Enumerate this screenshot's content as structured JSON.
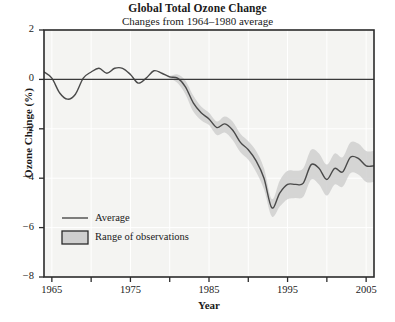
{
  "chart_data": {
    "type": "line",
    "title": "Global Total Ozone Change",
    "subtitle": "Changes from 1964–1980 average",
    "xlabel": "Year",
    "ylabel": "Ozone Change (%)",
    "xlim": [
      1964,
      2006
    ],
    "ylim": [
      -8,
      2
    ],
    "xticks": [
      1965,
      1975,
      1985,
      1995,
      2005
    ],
    "xtick_labels": [
      "1965",
      "1975",
      "1985",
      "1995",
      "2005"
    ],
    "xminor_ticks": [
      1970,
      1980,
      1990,
      2000
    ],
    "yticks": [
      2,
      0,
      -2,
      -4,
      -6,
      -8
    ],
    "ytick_labels": [
      "2",
      "0",
      "−2",
      "−4",
      "−6",
      "−8"
    ],
    "grid": true,
    "zero_line": 0,
    "legend_position": "bottom-left",
    "colors": {
      "line": "#4a4a4a",
      "band": "#cccccc",
      "band_edge": "#333333",
      "plot_background": "#f4f4f2",
      "gridline": "#ffffff",
      "frame": "#2b2b2b",
      "text": "#1a1a1a"
    },
    "series": [
      {
        "name": "Average",
        "x": [
          1964,
          1965,
          1966,
          1967,
          1968,
          1969,
          1970,
          1971,
          1972,
          1973,
          1974,
          1975,
          1976,
          1977,
          1978,
          1979,
          1980,
          1981,
          1982,
          1983,
          1984,
          1985,
          1986,
          1987,
          1988,
          1989,
          1990,
          1991,
          1992,
          1993,
          1994,
          1995,
          1996,
          1997,
          1998,
          1999,
          2000,
          2001,
          2002,
          2003,
          2004,
          2005,
          2006
        ],
        "values": [
          0.3,
          0.05,
          -0.55,
          -0.8,
          -0.6,
          0.05,
          0.3,
          0.45,
          0.25,
          0.45,
          0.45,
          0.2,
          -0.15,
          0.05,
          0.35,
          0.25,
          0.1,
          0.05,
          -0.3,
          -0.95,
          -1.35,
          -1.6,
          -1.95,
          -1.8,
          -2.05,
          -2.55,
          -2.85,
          -3.3,
          -4.0,
          -5.2,
          -4.6,
          -4.25,
          -4.25,
          -4.2,
          -3.45,
          -3.6,
          -4.05,
          -3.6,
          -3.75,
          -3.15,
          -3.2,
          -3.5,
          -3.5
        ]
      }
    ],
    "band": {
      "name": "Range of observations",
      "x": [
        1964,
        1965,
        1966,
        1967,
        1968,
        1969,
        1970,
        1971,
        1972,
        1973,
        1974,
        1975,
        1976,
        1977,
        1978,
        1979,
        1980,
        1981,
        1982,
        1983,
        1984,
        1985,
        1986,
        1987,
        1988,
        1989,
        1990,
        1991,
        1992,
        1993,
        1994,
        1995,
        1996,
        1997,
        1998,
        1999,
        2000,
        2001,
        2002,
        2003,
        2004,
        2005,
        2006
      ],
      "lower": [
        0.3,
        0.05,
        -0.55,
        -0.8,
        -0.6,
        0.05,
        0.3,
        0.45,
        0.25,
        0.45,
        0.45,
        0.2,
        -0.15,
        0.05,
        0.35,
        0.25,
        0.05,
        -0.15,
        -0.6,
        -1.3,
        -1.65,
        -1.85,
        -2.25,
        -2.15,
        -2.45,
        -2.95,
        -3.25,
        -3.75,
        -4.45,
        -5.55,
        -5.15,
        -4.85,
        -4.8,
        -4.75,
        -4.05,
        -4.25,
        -4.7,
        -4.25,
        -4.35,
        -3.8,
        -3.85,
        -4.15,
        -4.15
      ],
      "upper": [
        0.3,
        0.05,
        -0.55,
        -0.8,
        -0.6,
        0.05,
        0.3,
        0.45,
        0.25,
        0.45,
        0.45,
        0.2,
        -0.15,
        0.05,
        0.35,
        0.25,
        0.15,
        0.2,
        -0.05,
        -0.65,
        -1.1,
        -1.35,
        -1.7,
        -1.5,
        -1.7,
        -2.2,
        -2.5,
        -2.9,
        -3.6,
        -4.85,
        -4.1,
        -3.7,
        -3.7,
        -3.6,
        -2.85,
        -3.0,
        -3.45,
        -3.0,
        -3.15,
        -2.55,
        -2.6,
        -2.9,
        -2.9
      ]
    },
    "legend": [
      {
        "label": "Average",
        "marker": "line"
      },
      {
        "label": "Range of observations",
        "marker": "swatch"
      }
    ]
  }
}
